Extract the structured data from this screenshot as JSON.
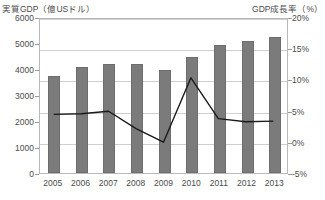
{
  "chart_data": {
    "type": "bar",
    "title": "",
    "categories": [
      "2005",
      "2006",
      "2007",
      "2008",
      "2009",
      "2010",
      "2011",
      "2012",
      "2013"
    ],
    "series": [
      {
        "name": "実質GDP（億USドル）",
        "type": "bar",
        "axis": "left",
        "values": [
          3750,
          4060,
          4180,
          4200,
          3960,
          4480,
          4930,
          5060,
          5230
        ]
      },
      {
        "name": "GDP成長率（%）",
        "type": "line",
        "axis": "right",
        "values": [
          4.6,
          4.7,
          5.1,
          2.3,
          0.1,
          10.5,
          3.9,
          3.4,
          3.5
        ]
      }
    ],
    "xlabel": "",
    "ylabel_left": "実質GDP（億USドル）",
    "ylabel_right": "GDP成長率（%）",
    "ylim_left": [
      0,
      6000
    ],
    "ylim_right": [
      -5,
      20
    ],
    "yticks_left": [
      "0",
      "1000",
      "2000",
      "3000",
      "4000",
      "5000",
      "6000"
    ],
    "ytick_values_left": [
      0,
      1000,
      2000,
      3000,
      4000,
      5000,
      6000
    ],
    "yticks_right": [
      "-5%",
      "0%",
      "5%",
      "10%",
      "15%",
      "20%"
    ],
    "ytick_values_right": [
      -5,
      0,
      5,
      10,
      15,
      20
    ],
    "grid": true,
    "legend": "none",
    "colors": {
      "bar": "#7b7b7b",
      "line": "#1a1a1a",
      "grid": "#cfcfcf",
      "frame": "#b9b9b9",
      "text": "#4a4a4a"
    }
  }
}
